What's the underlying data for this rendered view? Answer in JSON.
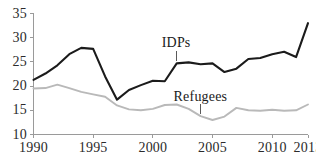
{
  "chart_data": {
    "type": "line",
    "title": "",
    "xlabel": "",
    "ylabel": "",
    "xlim": [
      1990,
      2013
    ],
    "ylim": [
      10,
      35
    ],
    "grid": false,
    "legend_position": "inline-annotation",
    "x": [
      1990,
      1991,
      1992,
      1993,
      1994,
      1995,
      1996,
      1997,
      1998,
      1999,
      2000,
      2001,
      2002,
      2003,
      2004,
      2005,
      2006,
      2007,
      2008,
      2009,
      2010,
      2011,
      2012,
      2013
    ],
    "xticks": [
      "1990",
      "1995",
      "2000",
      "2005",
      "2010",
      "2013"
    ],
    "xtick_values": [
      1990,
      1995,
      2000,
      2005,
      2010,
      2013
    ],
    "yticks": [
      "10",
      "15",
      "20",
      "25",
      "30",
      "35"
    ],
    "ytick_values": [
      10,
      15,
      20,
      25,
      30,
      35
    ],
    "series": [
      {
        "name": "IDPs",
        "color": "#1b1b1b",
        "values": [
          21.3,
          22.6,
          24.3,
          26.6,
          27.9,
          27.7,
          22.0,
          17.2,
          19.2,
          20.2,
          21.1,
          21.0,
          24.7,
          24.9,
          24.5,
          24.7,
          22.9,
          23.6,
          25.6,
          25.8,
          26.6,
          27.1,
          26.0,
          33.0
        ]
      },
      {
        "name": "Refugees",
        "color": "#b9b9b9",
        "values": [
          19.5,
          19.6,
          20.3,
          19.6,
          18.8,
          18.3,
          17.8,
          16.0,
          15.2,
          15.0,
          15.3,
          16.1,
          16.2,
          15.3,
          13.8,
          13.0,
          13.7,
          15.5,
          15.0,
          14.9,
          15.1,
          14.9,
          15.0,
          16.2
        ]
      }
    ],
    "annotations": [
      {
        "text": "IDPs",
        "year": 2002,
        "value": 24.7,
        "series": "IDPs"
      },
      {
        "text": "Refugees",
        "year": 2004,
        "value": 13.8,
        "series": "Refugees"
      }
    ]
  },
  "ghost_title": ""
}
